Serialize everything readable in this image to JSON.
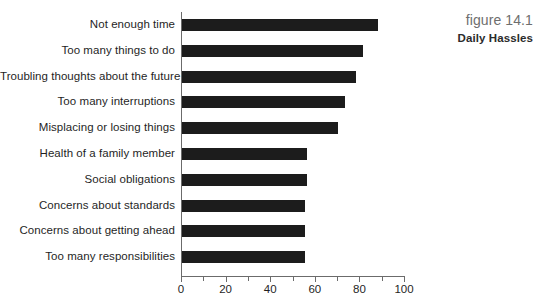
{
  "figure": {
    "number": "figure 14.1",
    "title": "Daily Hassles"
  },
  "chart_data": {
    "type": "bar",
    "orientation": "horizontal",
    "title": "Daily Hassles",
    "xlabel": "",
    "ylabel": "",
    "xlim": [
      0,
      100
    ],
    "grid": false,
    "legend": null,
    "tick_step_major": 20,
    "tick_step_minor": 10,
    "tick_labels": [
      "0",
      "20",
      "40",
      "60",
      "80",
      "100"
    ],
    "tick_values": [
      0,
      20,
      40,
      60,
      80,
      100
    ],
    "bar_color": "#1c1c1c",
    "axis_color": "#6b6b6b",
    "categories": [
      "Not enough time",
      "Too many things to do",
      "Troubling thoughts about the future",
      "Too many interruptions",
      "Misplacing or losing things",
      "Health of a family member",
      "Social obligations",
      "Concerns about standards",
      "Concerns about getting ahead",
      "Too many responsibilities"
    ],
    "values": [
      88,
      81,
      78,
      73,
      70,
      56,
      56,
      55,
      55,
      55
    ]
  }
}
